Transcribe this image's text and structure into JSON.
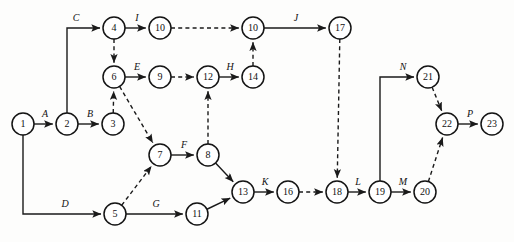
{
  "page": {
    "header_fragment": "",
    "canvas": {
      "width": 514,
      "height": 242
    },
    "colors": {
      "background": "#fdfdfc",
      "stroke": "#1a1a1a",
      "node_fill": "#ffffff",
      "text": "#111111"
    }
  },
  "nodes": [
    {
      "id": "n1",
      "label": "1",
      "x": 23,
      "y": 124
    },
    {
      "id": "n2",
      "label": "2",
      "x": 67,
      "y": 124
    },
    {
      "id": "n3",
      "label": "3",
      "x": 113,
      "y": 124
    },
    {
      "id": "n4",
      "label": "4",
      "x": 114,
      "y": 28
    },
    {
      "id": "n5",
      "label": "5",
      "x": 115,
      "y": 214
    },
    {
      "id": "n6",
      "label": "6",
      "x": 114,
      "y": 77
    },
    {
      "id": "n7",
      "label": "7",
      "x": 160,
      "y": 155
    },
    {
      "id": "n8",
      "label": "8",
      "x": 208,
      "y": 155
    },
    {
      "id": "n9",
      "label": "9",
      "x": 160,
      "y": 77
    },
    {
      "id": "n10a",
      "label": "10",
      "x": 160,
      "y": 28
    },
    {
      "id": "n10b",
      "label": "10",
      "x": 253,
      "y": 28
    },
    {
      "id": "n11",
      "label": "11",
      "x": 197,
      "y": 214
    },
    {
      "id": "n12",
      "label": "12",
      "x": 208,
      "y": 77
    },
    {
      "id": "n13",
      "label": "13",
      "x": 243,
      "y": 192
    },
    {
      "id": "n14",
      "label": "14",
      "x": 253,
      "y": 77
    },
    {
      "id": "n16",
      "label": "16",
      "x": 288,
      "y": 192
    },
    {
      "id": "n17",
      "label": "17",
      "x": 340,
      "y": 28
    },
    {
      "id": "n18",
      "label": "18",
      "x": 337,
      "y": 192
    },
    {
      "id": "n19",
      "label": "19",
      "x": 380,
      "y": 192
    },
    {
      "id": "n20",
      "label": "20",
      "x": 425,
      "y": 192
    },
    {
      "id": "n21",
      "label": "21",
      "x": 428,
      "y": 77
    },
    {
      "id": "n22",
      "label": "22",
      "x": 447,
      "y": 124
    },
    {
      "id": "n23",
      "label": "23",
      "x": 492,
      "y": 124
    }
  ],
  "node_radius": 11,
  "edges": [
    {
      "id": "e-A",
      "from": "n1",
      "to": "n2",
      "style": "solid",
      "label": "A",
      "label_x": 45,
      "label_y": 117,
      "shape": "straight"
    },
    {
      "id": "e-B",
      "from": "n2",
      "to": "n3",
      "style": "solid",
      "label": "B",
      "label_x": 90,
      "label_y": 117,
      "shape": "straight"
    },
    {
      "id": "e-C",
      "from": "n2",
      "to": "n4",
      "style": "solid",
      "label": "C",
      "label_x": 76,
      "label_y": 21,
      "shape": "elbow-up-right"
    },
    {
      "id": "e-D",
      "from": "n1",
      "to": "n5",
      "style": "solid",
      "label": "D",
      "label_x": 65,
      "label_y": 207,
      "shape": "elbow-down-right"
    },
    {
      "id": "e-E",
      "from": "n6",
      "to": "n9",
      "style": "solid",
      "label": "E",
      "label_x": 137,
      "label_y": 70,
      "shape": "straight"
    },
    {
      "id": "e-F",
      "from": "n7",
      "to": "n8",
      "style": "solid",
      "label": "F",
      "label_x": 184,
      "label_y": 148,
      "shape": "straight"
    },
    {
      "id": "e-G",
      "from": "n5",
      "to": "n11",
      "style": "solid",
      "label": "G",
      "label_x": 156,
      "label_y": 207,
      "shape": "straight"
    },
    {
      "id": "e-H",
      "from": "n12",
      "to": "n14",
      "style": "solid",
      "label": "H",
      "label_x": 230,
      "label_y": 70,
      "shape": "straight"
    },
    {
      "id": "e-I",
      "from": "n4",
      "to": "n10a",
      "style": "solid",
      "label": "I",
      "label_x": 137,
      "label_y": 21,
      "shape": "straight"
    },
    {
      "id": "e-J",
      "from": "n10b",
      "to": "n17",
      "style": "solid",
      "label": "J",
      "label_x": 296,
      "label_y": 21,
      "shape": "straight"
    },
    {
      "id": "e-K",
      "from": "n13",
      "to": "n16",
      "style": "solid",
      "label": "K",
      "label_x": 265,
      "label_y": 185,
      "shape": "straight"
    },
    {
      "id": "e-L",
      "from": "n18",
      "to": "n19",
      "style": "solid",
      "label": "L",
      "label_x": 358,
      "label_y": 185,
      "shape": "straight"
    },
    {
      "id": "e-M",
      "from": "n19",
      "to": "n20",
      "style": "solid",
      "label": "M",
      "label_x": 403,
      "label_y": 185,
      "shape": "straight"
    },
    {
      "id": "e-N",
      "from": "n19",
      "to": "n21",
      "style": "solid",
      "label": "N",
      "label_x": 403,
      "label_y": 70,
      "shape": "elbow-up-right"
    },
    {
      "id": "e-P",
      "from": "n22",
      "to": "n23",
      "style": "solid",
      "label": "P",
      "label_x": 470,
      "label_y": 117,
      "shape": "straight"
    },
    {
      "id": "e-8-13",
      "from": "n8",
      "to": "n13",
      "style": "solid",
      "label": "",
      "label_x": 0,
      "label_y": 0,
      "shape": "straight"
    },
    {
      "id": "e-11-13",
      "from": "n11",
      "to": "n13",
      "style": "solid",
      "label": "",
      "label_x": 0,
      "label_y": 0,
      "shape": "straight"
    },
    {
      "id": "e-4-6",
      "from": "n4",
      "to": "n6",
      "style": "dashed",
      "label": "",
      "label_x": 0,
      "label_y": 0,
      "shape": "straight"
    },
    {
      "id": "e-3-6",
      "from": "n3",
      "to": "n6",
      "style": "dashed",
      "label": "",
      "label_x": 0,
      "label_y": 0,
      "shape": "straight"
    },
    {
      "id": "e-6-7",
      "from": "n6",
      "to": "n7",
      "style": "dashed",
      "label": "",
      "label_x": 0,
      "label_y": 0,
      "shape": "straight"
    },
    {
      "id": "e-5-7",
      "from": "n5",
      "to": "n7",
      "style": "dashed",
      "label": "",
      "label_x": 0,
      "label_y": 0,
      "shape": "straight"
    },
    {
      "id": "e-8-12",
      "from": "n8",
      "to": "n12",
      "style": "dashed",
      "label": "",
      "label_x": 0,
      "label_y": 0,
      "shape": "straight"
    },
    {
      "id": "e-9-12",
      "from": "n9",
      "to": "n12",
      "style": "dashed",
      "label": "",
      "label_x": 0,
      "label_y": 0,
      "shape": "straight"
    },
    {
      "id": "e-10a-10b",
      "from": "n10a",
      "to": "n10b",
      "style": "dashed",
      "label": "",
      "label_x": 0,
      "label_y": 0,
      "shape": "straight"
    },
    {
      "id": "e-14-10b",
      "from": "n14",
      "to": "n10b",
      "style": "dashed",
      "label": "",
      "label_x": 0,
      "label_y": 0,
      "shape": "straight"
    },
    {
      "id": "e-17-18",
      "from": "n17",
      "to": "n18",
      "style": "dashed",
      "label": "",
      "label_x": 0,
      "label_y": 0,
      "shape": "straight"
    },
    {
      "id": "e-16-18",
      "from": "n16",
      "to": "n18",
      "style": "dashed",
      "label": "",
      "label_x": 0,
      "label_y": 0,
      "shape": "straight"
    },
    {
      "id": "e-21-22",
      "from": "n21",
      "to": "n22",
      "style": "dashed",
      "label": "",
      "label_x": 0,
      "label_y": 0,
      "shape": "straight"
    },
    {
      "id": "e-20-22",
      "from": "n20",
      "to": "n22",
      "style": "dashed",
      "label": "",
      "label_x": 0,
      "label_y": 0,
      "shape": "straight"
    }
  ]
}
